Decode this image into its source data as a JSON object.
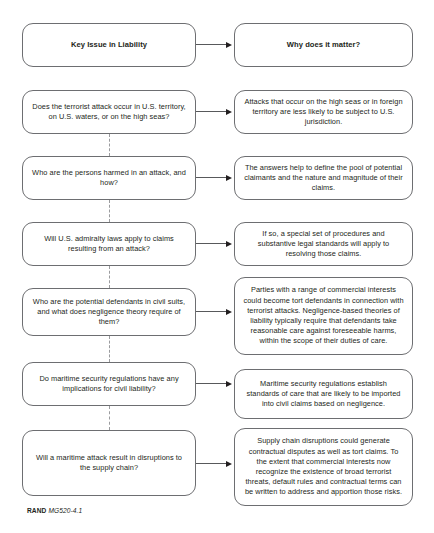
{
  "figure": {
    "footer_brand": "RAND",
    "footer_code": "MG520-4.1",
    "line_color": "#6d6e71",
    "arrow_color": "#231f20",
    "dash_color": "#9a9b9e",
    "background": "#ffffff"
  },
  "header": {
    "left": "Key Issue in Liability",
    "right": "Why does it matter?"
  },
  "rows": [
    {
      "issue": "Does the terrorist attack occur in U.S. territory, on U.S. waters, or on the high seas?",
      "matter": "Attacks that occur on the high seas or in foreign territory are less likely to be subject to U.S. jurisdiction."
    },
    {
      "issue": "Who are the persons harmed in an attack, and how?",
      "matter": "The answers help to define the pool of potential claimants and the nature and magnitude of their claims."
    },
    {
      "issue": "Will U.S. admiralty laws apply to claims resulting from an attack?",
      "matter": "If so, a special set of procedures and substantive legal standards will apply to resolving those claims."
    },
    {
      "issue": "Who are the potential defendants in civil suits, and what does negligence theory require of them?",
      "matter": "Parties with a range of commercial interests could become tort defendants in connection with terrorist attacks. Negligence-based theories of liability typically require that defendants take reasonable care against foreseeable harms, within the scope of their duties of care."
    },
    {
      "issue": "Do maritime security regulations have any implications for civil liability?",
      "matter": "Maritime security regulations establish standards of care that are likely to be imported into civil claims based on negligence."
    },
    {
      "issue": "Will a maritime attack result in disruptions to the supply chain?",
      "matter": "Supply chain disruptions could generate contractual disputes as well as tort claims. To the extent that commercial interests now recognize the existence of broad terrorist threats, default rules and contractual terms can be written to address and apportion those risks."
    }
  ]
}
